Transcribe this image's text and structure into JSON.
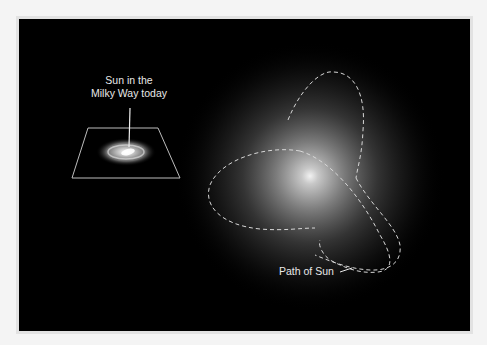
{
  "figure": {
    "labels": {
      "milky_way_line1": "Sun in the",
      "milky_way_line2": "Milky Way today",
      "path": "Path of Sun"
    },
    "colors": {
      "background": "#000000",
      "frame": "#f4f4f4",
      "glow_core": "#ffffff",
      "path_dash": "#d8d8d8",
      "text": "#e8e8e8"
    }
  }
}
